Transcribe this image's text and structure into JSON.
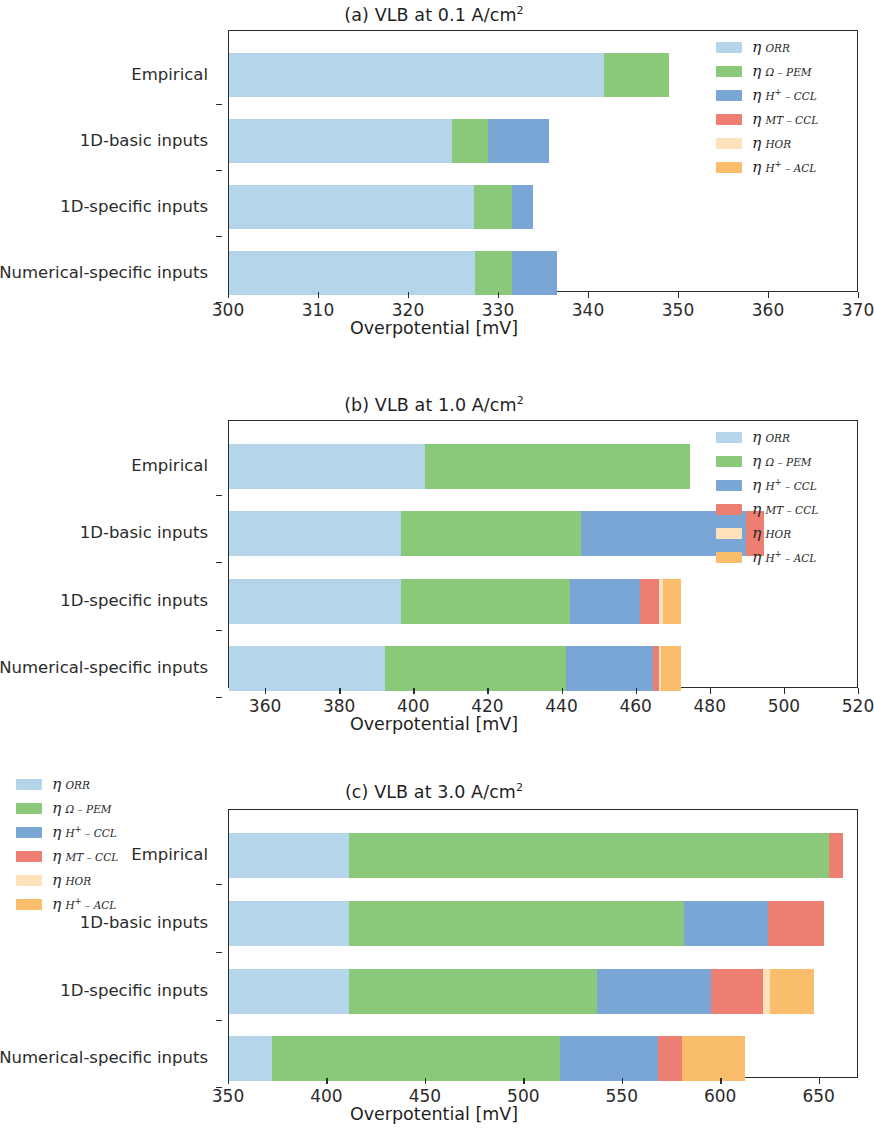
{
  "figure": {
    "xaxis_title": "Overpotential [mV]",
    "category_labels": [
      "Empirical",
      "1D-basic inputs",
      "1D-specific inputs",
      "Numerical-specific inputs"
    ],
    "series_names": [
      "eta_ORR",
      "eta_Omega-PEM",
      "eta_H+-CCL",
      "eta_MT-CCL",
      "eta_HOR",
      "eta_H+-ACL"
    ],
    "colors": {
      "eta_ORR": "#b5d6ea",
      "eta_Omega-PEM": "#8bc97a",
      "eta_H+-CCL": "#7aa6d6",
      "eta_MT-CCL": "#ec7f72",
      "eta_HOR": "#fde2bb",
      "eta_H+-ACL": "#f9bd6b",
      "axis": "#2b2b2b",
      "text": "#262626"
    },
    "legend_labels": [
      {
        "eta": "η",
        "sub": "ORR",
        "sup": ""
      },
      {
        "eta": "η",
        "sub": "Ω – PEM",
        "sup": ""
      },
      {
        "eta": "η",
        "sub": "H",
        "sup": "+",
        "sub2": " – CCL"
      },
      {
        "eta": "η",
        "sub": "MT – CCL",
        "sup": ""
      },
      {
        "eta": "η",
        "sub": "HOR",
        "sup": ""
      },
      {
        "eta": "η",
        "sub": "H",
        "sup": "+",
        "sub2": " – ACL"
      }
    ]
  },
  "chart_data": [
    {
      "type": "bar",
      "orientation": "horizontal",
      "stacked": true,
      "title": "(a) VLB at 0.1 A/cm²",
      "title_text": "(a) VLB at 0.1 A/cm",
      "title_sup": "2",
      "xlabel": "Overpotential [mV]",
      "ylabel": "",
      "xlim": [
        300,
        370
      ],
      "xticks": [
        300,
        310,
        320,
        330,
        340,
        350,
        360,
        370
      ],
      "xticklabels": [
        "300",
        "310",
        "320",
        "330",
        "340",
        "350",
        "360",
        "370"
      ],
      "grid": false,
      "legend_position": "upper right (inside)",
      "baseline": 300,
      "categories": [
        "Empirical",
        "1D-basic inputs",
        "1D-specific inputs",
        "Numerical-specific inputs"
      ],
      "series": [
        {
          "name": "η ORR",
          "values": [
            41.7,
            24.8,
            27.2,
            27.3
          ]
        },
        {
          "name": "η Ω-PEM",
          "values": [
            7.2,
            4.0,
            4.2,
            4.2
          ]
        },
        {
          "name": "η H+-CCL",
          "values": [
            0.0,
            6.8,
            2.4,
            4.9
          ]
        },
        {
          "name": "η MT-CCL",
          "values": [
            0.0,
            0.0,
            0.0,
            0.0
          ]
        },
        {
          "name": "η HOR",
          "values": [
            0.0,
            0.0,
            0.0,
            0.0
          ]
        },
        {
          "name": "η H+-ACL",
          "values": [
            0.0,
            0.0,
            0.0,
            0.0
          ]
        }
      ],
      "totals": [
        348.9,
        335.6,
        333.8,
        336.4
      ]
    },
    {
      "type": "bar",
      "orientation": "horizontal",
      "stacked": true,
      "title": "(b) VLB at 1.0 A/cm²",
      "title_text": "(b) VLB at 1.0 A/cm",
      "title_sup": "2",
      "xlabel": "Overpotential [mV]",
      "ylabel": "",
      "xlim": [
        350,
        520
      ],
      "xticks": [
        360,
        380,
        400,
        420,
        440,
        460,
        480,
        500,
        520
      ],
      "xticklabels": [
        "360",
        "380",
        "400",
        "420",
        "440",
        "460",
        "480",
        "500",
        "520"
      ],
      "grid": false,
      "legend_position": "upper right (inside)",
      "baseline": 350,
      "categories": [
        "Empirical",
        "1D-basic inputs",
        "1D-specific inputs",
        "Numerical-specific inputs"
      ],
      "series": [
        {
          "name": "η ORR",
          "values": [
            53.0,
            46.5,
            46.5,
            42.0
          ]
        },
        {
          "name": "η Ω-PEM",
          "values": [
            71.5,
            48.5,
            45.5,
            49.0
          ]
        },
        {
          "name": "η H+-CCL",
          "values": [
            0.0,
            44.5,
            19.0,
            23.5
          ]
        },
        {
          "name": "η MT-CCL",
          "values": [
            0.0,
            5.0,
            5.0,
            1.5
          ]
        },
        {
          "name": "η HOR",
          "values": [
            0.0,
            0.0,
            1.0,
            0.5
          ]
        },
        {
          "name": "η H+-ACL",
          "values": [
            0.0,
            0.0,
            5.0,
            5.5
          ]
        }
      ],
      "totals": [
        474.5,
        494.5,
        472.0,
        472.0
      ]
    },
    {
      "type": "bar",
      "orientation": "horizontal",
      "stacked": true,
      "title": "(c) VLB at 3.0 A/cm²",
      "title_text": "(c) VLB at 3.0 A/cm",
      "title_sup": "2",
      "xlabel": "Overpotential [mV]",
      "ylabel": "",
      "xlim": [
        350,
        670
      ],
      "xticks": [
        350,
        400,
        450,
        500,
        550,
        600,
        650
      ],
      "xticklabels": [
        "350",
        "400",
        "450",
        "500",
        "550",
        "600",
        "650"
      ],
      "grid": false,
      "legend_position": "upper left (inside)",
      "baseline": 350,
      "categories": [
        "Empirical",
        "1D-basic inputs",
        "1D-specific inputs",
        "Numerical-specific inputs"
      ],
      "series": [
        {
          "name": "η ORR",
          "values": [
            61.0,
            61.0,
            61.0,
            22.0
          ]
        },
        {
          "name": "η Ω-PEM",
          "values": [
            244.0,
            170.0,
            126.0,
            146.0
          ]
        },
        {
          "name": "η H+-CCL",
          "values": [
            0.0,
            43.0,
            58.0,
            50.0
          ]
        },
        {
          "name": "η MT-CCL",
          "values": [
            7.0,
            28.0,
            26.0,
            12.0
          ]
        },
        {
          "name": "η HOR",
          "values": [
            0.0,
            0.0,
            4.0,
            0.0
          ]
        },
        {
          "name": "η H+-ACL",
          "values": [
            0.0,
            0.0,
            22.0,
            32.0
          ]
        }
      ],
      "totals": [
        662.0,
        652.0,
        647.0,
        612.0
      ]
    }
  ]
}
